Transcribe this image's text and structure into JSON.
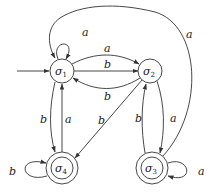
{
  "diagram": {
    "type": "finite-state-automaton",
    "start_state": "σ1",
    "states": [
      {
        "id": "s1",
        "name": "σ",
        "sub": "1",
        "accepting": false,
        "initial": true
      },
      {
        "id": "s2",
        "name": "σ",
        "sub": "2",
        "accepting": false,
        "initial": false
      },
      {
        "id": "s3",
        "name": "σ",
        "sub": "3",
        "accepting": true,
        "initial": false
      },
      {
        "id": "s4",
        "name": "σ",
        "sub": "4",
        "accepting": true,
        "initial": false
      }
    ],
    "transitions": [
      {
        "from": "σ1",
        "to": "σ1",
        "label": "a"
      },
      {
        "from": "σ1",
        "to": "σ2",
        "label": "a"
      },
      {
        "from": "σ1",
        "to": "σ2",
        "label": "b"
      },
      {
        "from": "σ2",
        "to": "σ1",
        "label": "b"
      },
      {
        "from": "σ1",
        "to": "σ4",
        "label": "b"
      },
      {
        "from": "σ4",
        "to": "σ1",
        "label": "a"
      },
      {
        "from": "σ2",
        "to": "σ4",
        "label": "b"
      },
      {
        "from": "σ2",
        "to": "σ3",
        "label": "a"
      },
      {
        "from": "σ3",
        "to": "σ2",
        "label": "b"
      },
      {
        "from": "σ3",
        "to": "σ1",
        "label": "a"
      },
      {
        "from": "σ3",
        "to": "σ3",
        "label": "a"
      },
      {
        "from": "σ4",
        "to": "σ4",
        "label": "b"
      }
    ],
    "labels": {
      "s1_loop": "a",
      "s1_s2_a": "a",
      "s1_s2_b": "b",
      "s2_s1_b": "b",
      "s1_s4_b": "b",
      "s4_s1_a": "a",
      "s2_s4_b": "b",
      "s2_s3_a": "a",
      "s3_s2_b": "b",
      "s3_s1_a": "a",
      "s3_loop": "a",
      "s4_loop": "b"
    }
  }
}
